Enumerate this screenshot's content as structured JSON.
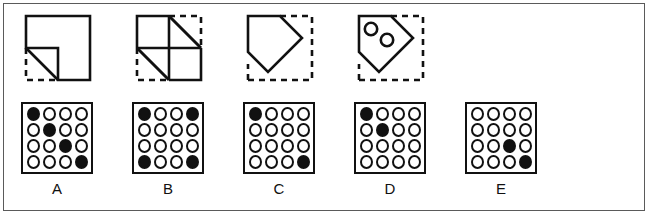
{
  "figure": {
    "background_color": "#ffffff",
    "ink_color": "#111111",
    "frame_color": "#5a5a5a"
  },
  "stimulus": {
    "count": 4,
    "description": "Four folding-stage figures, each drawn inside a dashed square outline",
    "items": [
      {
        "id": "stage-1",
        "name": "square-with-corner-notch",
        "dashed_region": "bottom-left-quadrant"
      },
      {
        "id": "stage-2",
        "name": "square-quartered-with-two-diagonals",
        "dashed_region": "top-right-and-bottom-left"
      },
      {
        "id": "stage-3",
        "name": "pentagon-arrow-folded",
        "dashed_region": "right-and-bottom"
      },
      {
        "id": "stage-4",
        "name": "pentagon-arrow-with-two-holes",
        "dashed_region": "right-and-bottom",
        "holes": 2
      }
    ]
  },
  "options": {
    "grid_rows": 4,
    "grid_cols": 4,
    "items": [
      {
        "label": "A",
        "name": "option-a",
        "filled_cells": [
          [
            0,
            0
          ],
          [
            1,
            1
          ],
          [
            2,
            2
          ],
          [
            3,
            3
          ]
        ],
        "pattern_description": "main diagonal top-left to bottom-right"
      },
      {
        "label": "B",
        "name": "option-b",
        "filled_cells": [
          [
            0,
            0
          ],
          [
            0,
            3
          ],
          [
            3,
            0
          ],
          [
            3,
            3
          ]
        ],
        "pattern_description": "four corners"
      },
      {
        "label": "C",
        "name": "option-c",
        "filled_cells": [
          [
            0,
            0
          ],
          [
            3,
            3
          ]
        ],
        "pattern_description": "top-left and bottom-right corners"
      },
      {
        "label": "D",
        "name": "option-d",
        "filled_cells": [
          [
            0,
            0
          ],
          [
            1,
            1
          ]
        ],
        "pattern_description": "two upper-left diagonal cells"
      },
      {
        "label": "E",
        "name": "option-e",
        "filled_cells": [
          [
            2,
            2
          ],
          [
            3,
            3
          ]
        ],
        "pattern_description": "two lower-right diagonal cells"
      }
    ]
  }
}
